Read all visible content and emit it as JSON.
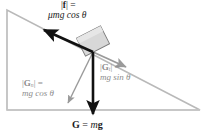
{
  "diagram": {
    "colors": {
      "incline_stroke": "#b9b9b9",
      "incline_fill": "#ffffff",
      "block_fill": "#d8d8d8",
      "block_stroke": "#7a7a7a",
      "vector_dark": "#111111",
      "vector_gray": "#9a9a9a",
      "text_dark": "#1a1a1a",
      "text_gray": "#8d8d8d"
    },
    "incline": {
      "apex_top_left": [
        7,
        10
      ],
      "corner_bottom_left": [
        7,
        110
      ],
      "corner_bottom_right": [
        200,
        110
      ]
    },
    "block": {
      "center": [
        93,
        41
      ],
      "width": 27,
      "height": 20,
      "rotation_deg": -27
    },
    "labels": {
      "friction": {
        "line1_symbol": "|f| =",
        "line1_bar_left": "|",
        "line1_vector": "f",
        "line1_bar_right": "| =",
        "line2": "μmg cos θ",
        "color": "#1a1a1a"
      },
      "normal_component": {
        "line1_bar_left": "|",
        "line1_vector": "G",
        "line1_sub": "n",
        "line1_bar_right": "| =",
        "line2": "mg cos θ",
        "color": "#8d8d8d"
      },
      "tangential_component": {
        "line1_bar_left": "|",
        "line1_vector": "G",
        "line1_sub": "t",
        "line1_bar_right": "| =",
        "line2": "mg sin θ",
        "color": "#8d8d8d"
      },
      "weight": {
        "vector": "G",
        "equals": " = ",
        "mass": "m",
        "gravity": "g",
        "color": "#1a1a1a"
      }
    },
    "vectors": [
      {
        "name": "friction-vector",
        "label": "|f| = μmg cos θ",
        "from": [
          93,
          52
        ],
        "to": [
          41,
          28
        ],
        "style": "thick-black",
        "direction": "up-slope"
      },
      {
        "name": "tangential-component-vector",
        "label": "|Gt| = mg sin θ",
        "from": [
          93,
          52
        ],
        "to": [
          128,
          68
        ],
        "style": "gray",
        "direction": "down-slope"
      },
      {
        "name": "normal-component-vector",
        "label": "|Gn| = mg cos θ",
        "from": [
          93,
          52
        ],
        "to": [
          67,
          105
        ],
        "style": "gray",
        "direction": "into-incline"
      },
      {
        "name": "weight-vector",
        "label": "G = mg",
        "from": [
          93,
          52
        ],
        "to": [
          93,
          117
        ],
        "style": "thick-black",
        "direction": "straight-down"
      }
    ]
  }
}
